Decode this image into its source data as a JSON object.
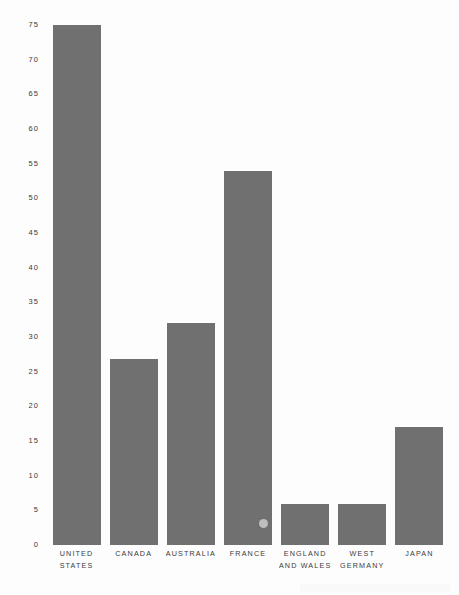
{
  "chart_data": {
    "type": "bar",
    "title": "",
    "subtitle": "",
    "xlabel": "",
    "ylabel": "",
    "categories": [
      "UNITED\nSTATES",
      "CANADA",
      "AUSTRALIA",
      "FRANCE",
      "ENGLAND\nAND WALES",
      "WEST\nGERMANY",
      "JAPAN"
    ],
    "values": [
      75.0,
      26.8,
      32.0,
      54.0,
      5.9,
      5.9,
      17.0
    ],
    "ylim": [
      0,
      75
    ],
    "ytick_values": [
      0,
      5,
      10,
      15,
      20,
      25,
      30,
      35,
      40,
      45,
      50,
      55,
      60,
      65,
      70,
      75
    ],
    "ytick_labels": [
      "0",
      "5",
      "10",
      "15",
      "20",
      "25",
      "30",
      "35",
      "40",
      "45",
      "50",
      "55",
      "60",
      "65",
      "70",
      "75"
    ],
    "grid": false,
    "legend": false,
    "legend_position": "none",
    "bar_color": "#707070",
    "background_color": "#fdfdfd",
    "text_color": "#3a3a3a"
  }
}
